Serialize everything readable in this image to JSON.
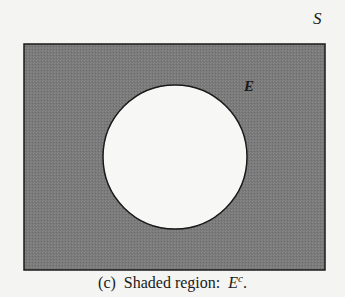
{
  "figure": {
    "type": "venn-diagram",
    "sample_space_label": "S",
    "event_label": "E",
    "caption_prefix": "(c)  Shaded region:  ",
    "caption_symbol": "E",
    "caption_superscript": "c",
    "caption_suffix": ".",
    "colors": {
      "shaded": "#7a7a7a",
      "unshaded": "#f7f7f5",
      "outline": "#1a1a1a",
      "background": "#f4f4f2"
    }
  }
}
